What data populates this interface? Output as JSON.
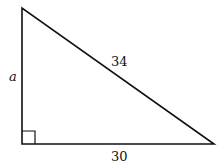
{
  "diagram": {
    "type": "right-triangle",
    "vertices": {
      "top": [
        22,
        8
      ],
      "right_angle": [
        22,
        144
      ],
      "right": [
        214,
        144
      ]
    },
    "labels": {
      "vertical_leg": "a",
      "hypotenuse": "34",
      "base": "30"
    },
    "right_angle_marker": true,
    "stroke_color": "#111111"
  }
}
